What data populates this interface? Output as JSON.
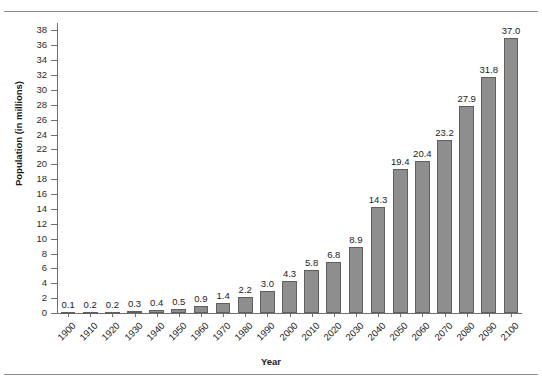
{
  "chart_data": {
    "type": "bar",
    "title": "",
    "xlabel": "Year",
    "ylabel": "Population (in millions)",
    "ylim": [
      0,
      39
    ],
    "ytick_labels": [
      "0",
      "2",
      "4",
      "6",
      "8",
      "10",
      "12",
      "14",
      "16",
      "18",
      "20",
      "22",
      "24",
      "26",
      "28",
      "30",
      "32",
      "34",
      "36",
      "38"
    ],
    "ytick_values": [
      0,
      2,
      4,
      6,
      8,
      10,
      12,
      14,
      16,
      18,
      20,
      22,
      24,
      26,
      28,
      30,
      32,
      34,
      36,
      38
    ],
    "grid": false,
    "legend": null,
    "categories": [
      "1900",
      "1910",
      "1920",
      "1930",
      "1940",
      "1950",
      "1960",
      "1970",
      "1980",
      "1990",
      "2000",
      "2010",
      "2020",
      "2030",
      "2040",
      "2050",
      "2060",
      "2070",
      "2080",
      "2090",
      "2100"
    ],
    "values": [
      0.1,
      0.2,
      0.2,
      0.3,
      0.4,
      0.5,
      0.9,
      1.4,
      2.2,
      3.0,
      4.3,
      5.8,
      6.8,
      8.9,
      14.3,
      19.4,
      20.4,
      23.2,
      27.9,
      31.8,
      37.0
    ],
    "data_labels": [
      "0.1",
      "0.2",
      "0.2",
      "0.3",
      "0.4",
      "0.5",
      "0.9",
      "1.4",
      "2.2",
      "3.0",
      "4.3",
      "5.8",
      "6.8",
      "8.9",
      "14.3",
      "19.4",
      "20.4",
      "23.2",
      "27.9",
      "31.8",
      "37.0"
    ],
    "bar_color": "#8e8e8e",
    "bar_edge_color": "#5f5f5f",
    "axis_color": "#6f6f6f",
    "text_color": "#1c1c1c",
    "background": "#ffffff"
  }
}
